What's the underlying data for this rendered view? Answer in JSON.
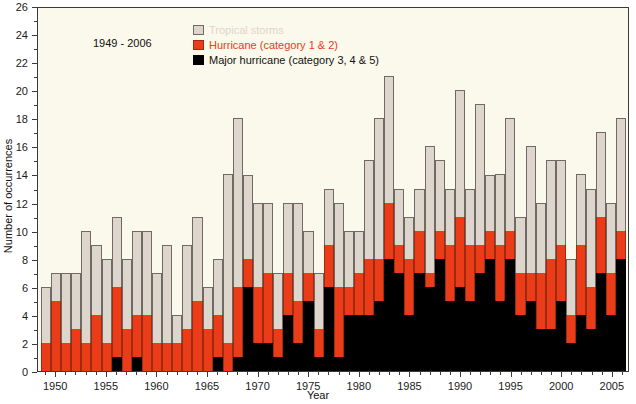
{
  "chart_data": {
    "type": "bar",
    "stacked": true,
    "title": "",
    "xlabel": "Year",
    "ylabel": "Number of occurrences",
    "ylim": [
      0,
      26
    ],
    "ytick_step": 2,
    "yticks": [
      0,
      2,
      4,
      6,
      8,
      10,
      12,
      14,
      16,
      18,
      20,
      22,
      24,
      26
    ],
    "xlim": [
      1949,
      2006
    ],
    "xticks": [
      1950,
      1955,
      1960,
      1965,
      1970,
      1975,
      1980,
      1985,
      1990,
      1995,
      2000,
      2005
    ],
    "grid": false,
    "legend_position": "top-left",
    "period_label": "1949 - 2006",
    "series": [
      {
        "name": "Tropical storms",
        "color": "#ded6cd",
        "values": [
          4,
          2,
          5,
          4,
          8,
          5,
          6,
          5,
          5,
          6,
          6,
          5,
          7,
          2,
          6,
          6,
          3,
          4,
          12,
          12,
          6,
          6,
          5,
          4,
          5,
          7,
          3,
          4,
          4,
          6,
          4,
          3,
          7,
          10,
          9,
          4,
          3,
          3,
          9,
          5,
          4,
          9,
          4,
          10,
          4,
          5,
          8,
          4,
          9,
          5,
          7,
          6,
          4,
          5,
          7,
          6,
          5,
          8
        ]
      },
      {
        "name": "Hurricane (category 1 & 2)",
        "color": "#ea3c18",
        "values": [
          2,
          5,
          2,
          3,
          2,
          4,
          2,
          5,
          3,
          3,
          4,
          2,
          2,
          2,
          3,
          5,
          3,
          3,
          2,
          5,
          2,
          4,
          5,
          2,
          3,
          3,
          2,
          2,
          3,
          5,
          2,
          3,
          4,
          3,
          4,
          2,
          4,
          3,
          1,
          2,
          4,
          5,
          4,
          2,
          2,
          4,
          2,
          3,
          2,
          4,
          5,
          4,
          2,
          5,
          3,
          4,
          3,
          2
        ]
      },
      {
        "name": "Major hurricane (category 3, 4 & 5)",
        "color": "#000000",
        "values": [
          0,
          0,
          0,
          0,
          0,
          0,
          0,
          1,
          0,
          1,
          0,
          0,
          0,
          0,
          0,
          0,
          0,
          1,
          0,
          1,
          6,
          2,
          2,
          1,
          4,
          2,
          5,
          1,
          6,
          1,
          4,
          4,
          4,
          5,
          8,
          7,
          4,
          7,
          6,
          8,
          5,
          6,
          5,
          7,
          8,
          5,
          8,
          4,
          5,
          3,
          3,
          5,
          2,
          4,
          3,
          7,
          4,
          8
        ]
      }
    ],
    "categories": [
      1949,
      1950,
      1951,
      1952,
      1953,
      1954,
      1955,
      1956,
      1957,
      1958,
      1959,
      1960,
      1961,
      1962,
      1963,
      1964,
      1965,
      1966,
      1967,
      1968,
      1969,
      1970,
      1971,
      1972,
      1973,
      1974,
      1975,
      1976,
      1977,
      1978,
      1979,
      1980,
      1981,
      1982,
      1983,
      1984,
      1985,
      1986,
      1987,
      1988,
      1989,
      1990,
      1991,
      1992,
      1993,
      1994,
      1995,
      1996,
      1997,
      1998,
      1999,
      2000,
      2001,
      2002,
      2003,
      2004,
      2005,
      2006
    ]
  },
  "legend": {
    "period": "1949 - 2006",
    "items": [
      {
        "label": "Tropical storms",
        "swatch": "trop"
      },
      {
        "label": "Hurricane (category 1 & 2)",
        "swatch": "hurr"
      },
      {
        "label": "Major hurricane (category 3, 4 & 5)",
        "swatch": "major"
      }
    ]
  },
  "axis_titles": {
    "y": "Number of occurrences",
    "x": "Year"
  },
  "colors": {
    "tropical": "#ded6cd",
    "hurricane": "#ea3c18",
    "major": "#000000",
    "plot_background": "#fbf8ec",
    "axis": "#3a3a3a"
  }
}
